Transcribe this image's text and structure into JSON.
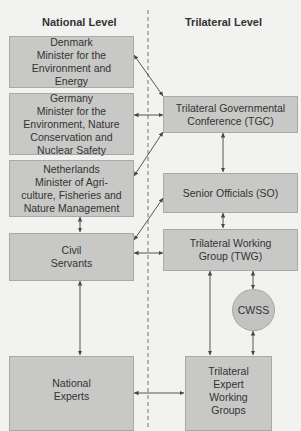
{
  "headings": {
    "national": "National Level",
    "trilateral": "Trilateral Level"
  },
  "national": {
    "denmark": [
      "Denmark",
      "Minister for the",
      "Environment and",
      "Energy"
    ],
    "germany": [
      "Germany",
      "Minister for the",
      "Environment, Nature",
      "Conservation and",
      "Nuclear Safety"
    ],
    "netherlands": [
      "Netherlands",
      "Minister of Agri-",
      "culture, Fisheries and",
      "Nature Management"
    ],
    "civil_servants": [
      "Civil",
      "Servants"
    ],
    "national_experts": [
      "National",
      "Experts"
    ]
  },
  "trilateral": {
    "tgc": [
      "Trilateral Governmental",
      "Conference (TGC)"
    ],
    "so": [
      "Senior Officials (SO)"
    ],
    "twg": [
      "Trilateral Working",
      "Group (TWG)"
    ],
    "cwss": "CWSS",
    "tewg": [
      "Trilateral",
      "Expert",
      "Working",
      "Groups"
    ]
  },
  "colors": {
    "box_fill": "#c8c8c6",
    "box_border": "#a9a9a7",
    "line": "#444444",
    "background": "#f2f2f0"
  }
}
